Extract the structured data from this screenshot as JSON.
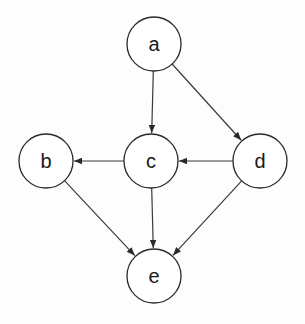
{
  "diagram": {
    "type": "directed-graph",
    "colors": {
      "stroke": "#2a2a2a",
      "background": "#fdfdfd",
      "node_fill": "#ffffff"
    },
    "nodes": [
      {
        "id": "a",
        "label": "a",
        "x": 154,
        "y": 44,
        "r": 27
      },
      {
        "id": "b",
        "label": "b",
        "x": 46,
        "y": 161,
        "r": 27
      },
      {
        "id": "c",
        "label": "c",
        "x": 151,
        "y": 161,
        "r": 27
      },
      {
        "id": "d",
        "label": "d",
        "x": 260,
        "y": 161,
        "r": 27
      },
      {
        "id": "e",
        "label": "e",
        "x": 154,
        "y": 276,
        "r": 27
      }
    ],
    "edges": [
      {
        "from": "a",
        "to": "c"
      },
      {
        "from": "a",
        "to": "d"
      },
      {
        "from": "c",
        "to": "b"
      },
      {
        "from": "d",
        "to": "c"
      },
      {
        "from": "b",
        "to": "e"
      },
      {
        "from": "c",
        "to": "e"
      },
      {
        "from": "d",
        "to": "e"
      }
    ]
  }
}
